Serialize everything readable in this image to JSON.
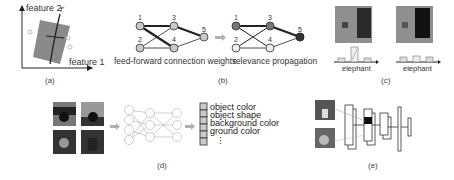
{
  "panels": {
    "a": {
      "caption": "(a)",
      "x_axis_label": "feature 1",
      "y_axis_label": "feature 2",
      "annotation": "f'"
    },
    "b": {
      "caption": "(b)",
      "left_label": "feed-forward connection weights",
      "right_label": "relevance propagation",
      "node_labels": [
        "1",
        "2",
        "3",
        "4",
        "5"
      ]
    },
    "c": {
      "caption": "(c)",
      "left_label": "elephant",
      "right_label": "elephant"
    },
    "d": {
      "caption": "(d)",
      "attributes": [
        "object color",
        "object shape",
        "background color",
        "ground color"
      ],
      "ellipsis": "⋮"
    },
    "e": {
      "caption": "(e)"
    }
  },
  "colors": {
    "line": "#333333",
    "node_fill": "#c8c8c8",
    "node_dark": "#555555",
    "arrow_gray": "#b0b0b0"
  }
}
